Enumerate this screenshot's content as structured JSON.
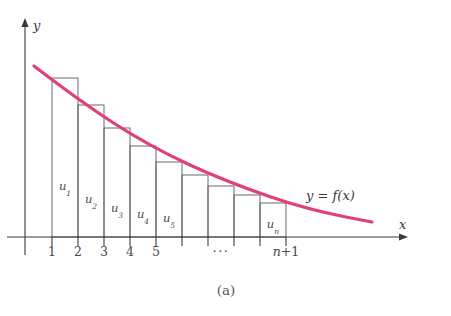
{
  "figure": {
    "caption": "(a)",
    "background_color": "#ffffff",
    "axis_color": "#3a3a3a",
    "bar_stroke_color": "#5a5a5a",
    "curve_color": "#E0407A"
  },
  "axes": {
    "y_label": "y",
    "x_label": "x",
    "origin": {
      "x": 25,
      "y": 237
    },
    "y_top": 18,
    "y_bottom": 255,
    "x_right": 408
  },
  "ticks": {
    "positions": [
      52,
      78,
      104,
      130,
      156,
      182,
      208,
      234,
      260,
      286
    ],
    "labels": [
      {
        "text": "1",
        "x": 52
      },
      {
        "text": "2",
        "x": 78
      },
      {
        "text": "3",
        "x": 104
      },
      {
        "text": "4",
        "x": 130
      },
      {
        "text": "5",
        "x": 156
      }
    ],
    "ellipsis": {
      "text": "···",
      "x": 221
    },
    "last_label": {
      "prefix": "n",
      "suffix": "+1",
      "x": 286
    },
    "label_y": 256,
    "tick_height": 9
  },
  "bars": [
    {
      "label": "u",
      "sub": "1",
      "x0": 52,
      "x1": 78,
      "top": 78,
      "label_x": 65,
      "label_y": 190
    },
    {
      "label": "u",
      "sub": "2",
      "x0": 78,
      "x1": 104,
      "top": 105,
      "label_x": 91,
      "label_y": 203
    },
    {
      "label": "u",
      "sub": "3",
      "x0": 104,
      "x1": 130,
      "top": 128,
      "label_x": 117,
      "label_y": 212
    },
    {
      "label": "u",
      "sub": "4",
      "x0": 130,
      "x1": 156,
      "top": 146,
      "label_x": 143,
      "label_y": 218
    },
    {
      "label": "u",
      "sub": "5",
      "x0": 156,
      "x1": 182,
      "top": 162,
      "label_x": 169,
      "label_y": 222
    },
    {
      "label": "",
      "sub": "",
      "x0": 182,
      "x1": 208,
      "top": 175,
      "label_x": 195,
      "label_y": 224
    },
    {
      "label": "",
      "sub": "",
      "x0": 208,
      "x1": 234,
      "top": 186,
      "label_x": 221,
      "label_y": 226
    },
    {
      "label": "",
      "sub": "",
      "x0": 234,
      "x1": 260,
      "top": 195,
      "label_x": 247,
      "label_y": 228
    },
    {
      "label": "u",
      "sub": "n",
      "x0": 260,
      "x1": 286,
      "top": 203,
      "label_x": 273,
      "label_y": 228
    }
  ],
  "curve": {
    "label_prefix": "y",
    "label_eq": " = ",
    "label_f": "f",
    "label_arg": "(x)",
    "label_x": 306,
    "label_y": 200,
    "path": "M 34,66 C 60,86 86,105 112,122 C 138,139 164,153 190,165 C 216,177 242,187 268,196 C 294,205 320,212 346,217 C 356,219 366,221 372,222",
    "start": {
      "x": 34,
      "y": 66
    },
    "end": {
      "x": 372,
      "y": 222
    }
  },
  "chart_data": {
    "type": "area",
    "title": "(a)",
    "xlabel": "x",
    "ylabel": "y",
    "categories": [
      "u1",
      "u2",
      "u3",
      "u4",
      "u5",
      "u6",
      "u7",
      "u8",
      "un"
    ],
    "x_intervals": [
      [
        1,
        2
      ],
      [
        2,
        3
      ],
      [
        3,
        4
      ],
      [
        4,
        5
      ],
      [
        5,
        6
      ],
      [
        6,
        7
      ],
      [
        7,
        8
      ],
      [
        8,
        9
      ],
      [
        9,
        10
      ]
    ],
    "values": [
      159,
      132,
      109,
      91,
      75,
      62,
      51,
      42,
      34
    ],
    "xlim": [
      0,
      14.7
    ],
    "ylim": [
      0,
      219
    ],
    "grid": false,
    "legend": "none",
    "series": [
      {
        "name": "y = f(x)",
        "color": "#E0407A",
        "x": [
          0.65,
          1.0,
          2.0,
          3.0,
          4.0,
          5.0,
          6.0,
          7.0,
          8.0,
          9.0,
          10.0,
          11.0,
          12.0,
          13.0,
          13.35
        ],
        "y": [
          171,
          159,
          132,
          109,
          91,
          75,
          62,
          51,
          42,
          34,
          28,
          23,
          19,
          16,
          15
        ]
      }
    ],
    "tick_labels_x": [
      "1",
      "2",
      "3",
      "4",
      "5",
      "···",
      "n+1"
    ],
    "annotations": [
      {
        "text": "y = f(x)",
        "x": 10.8,
        "y": 37
      },
      {
        "text": "(a)",
        "x": 7.0,
        "y": -60
      }
    ]
  }
}
